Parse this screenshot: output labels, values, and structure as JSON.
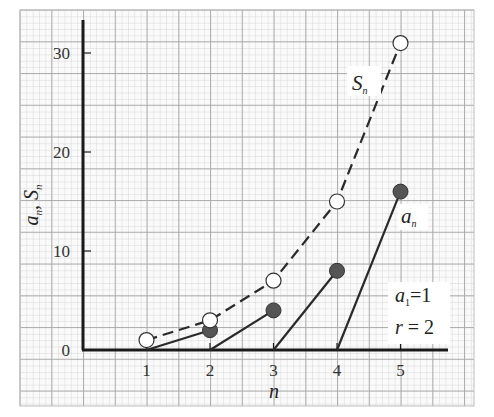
{
  "chart_data": {
    "type": "line",
    "title": "",
    "xlabel": "n",
    "ylabel": "a_n, S_n",
    "x": [
      1,
      2,
      3,
      4,
      5
    ],
    "xlim": [
      0,
      5.7
    ],
    "ylim": [
      0,
      33
    ],
    "x_ticks": [
      "1",
      "2",
      "3",
      "4",
      "5"
    ],
    "y_ticks": [
      "0",
      "10",
      "20",
      "30"
    ],
    "y_tick_values": [
      0,
      10,
      20,
      30
    ],
    "grid": true,
    "series": [
      {
        "name": "S_n",
        "label_main": "S",
        "label_sub": "n",
        "style": "dashed line, open circle markers",
        "x": [
          1,
          2,
          3,
          4,
          5
        ],
        "values": [
          1,
          3,
          7,
          15,
          31
        ]
      },
      {
        "name": "a_n",
        "label_main": "a",
        "label_sub": "n",
        "style": "filled circle markers, each joined by a solid segment from (n-1, 0)",
        "x": [
          1,
          2,
          3,
          4,
          5
        ],
        "values": [
          1,
          2,
          4,
          8,
          16
        ]
      }
    ],
    "annotations": {
      "param_a1": {
        "main": "a",
        "sub": "1",
        "rest": "=1"
      },
      "param_r": {
        "text": "r = 2",
        "var": "r",
        "rest": " = 2"
      }
    },
    "legend_position": "inline labels"
  },
  "colors": {
    "background": "#ffffff",
    "grid_minor": "#c8c8c8",
    "grid_major": "#9a9a9a",
    "axis": "#1a1a1a",
    "line": "#2a2a2a",
    "filled_marker": "#555555",
    "open_marker_fill": "#ffffff"
  }
}
